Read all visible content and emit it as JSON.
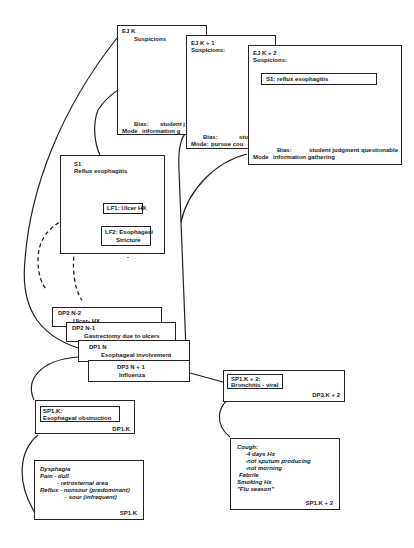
{
  "episodes": [
    {
      "title": "EJ K",
      "suspicions_label": "Suspicions",
      "bias_label": "Bias:",
      "bias_value": "student j",
      "mode_label": "Mode",
      "mode_value": "information g"
    },
    {
      "title": "EJ K + 1",
      "suspicions_label": "Suspicions:",
      "bias_label": "Bias:",
      "bias_value": "student",
      "mode_label": "Mode:",
      "mode_value": "pursue cou"
    },
    {
      "title": "EJ K + 2",
      "suspicions_label": "Suspicions:",
      "suspicion": "S1: reflux esophagitis",
      "bias_label": "Bias:",
      "bias_value": "student judgment questionable",
      "mode_label": "Mode",
      "mode_value": "information gathering"
    }
  ],
  "suspicion_box": {
    "title": "S1",
    "subtitle": "Reflux esophagitis",
    "lf1": "LF1: Ulcer HX",
    "lf2_line1": "LF2: Esophageal",
    "lf2_line2": "Stricture"
  },
  "data_points": [
    {
      "title": "DP2 N-2",
      "text": "Ulcer- HX"
    },
    {
      "title": "DP2 N-1",
      "text": "Gastrectomy due to ulcers"
    },
    {
      "title": "DP1 N",
      "text": "Esophageal involvement"
    },
    {
      "title": "DP3 N + 1",
      "text": "Influenza"
    }
  ],
  "sp1k": {
    "header": "SP1.K:",
    "value": "Esophageal obstruction",
    "footer": "DP1.K"
  },
  "sp1k2": {
    "header": "SP1.K + 2:",
    "value": "Bronchitis - viral",
    "footer": "DP3.K + 2"
  },
  "findings_left": {
    "lines": [
      "Dysphagia",
      "Pain - dull",
      "- retrosternal area",
      "Reflux - nonsour (predominant)",
      "- sour (infrequent)"
    ],
    "footer": "SP1.K"
  },
  "findings_right": {
    "lines": [
      "Cough:",
      "-4 days Hx",
      "-not sputum producing",
      "-not morning",
      "Febrile",
      "Smoking Hx",
      "\"Flu season\""
    ],
    "footer": "SP1.K + 2"
  }
}
